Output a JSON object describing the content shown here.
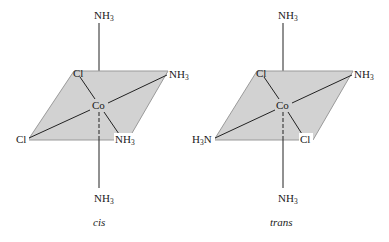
{
  "figure": {
    "type": "octahedral coordination complex isomers",
    "colors": {
      "plane_fill": "#d2d2d2",
      "plane_edge": "#9a9a9a",
      "bond": "#222222",
      "text": "#1a1a1a",
      "background": "#ffffff"
    },
    "isomers": [
      {
        "caption": "cis",
        "center": "Co",
        "ligands": {
          "top": {
            "main": "NH",
            "sub": "3"
          },
          "bottom": {
            "main": "NH",
            "sub": "3"
          },
          "back_left": {
            "main": "Cl",
            "sub": ""
          },
          "back_right": {
            "main": "NH",
            "sub": "3"
          },
          "front_left": {
            "main": "Cl",
            "sub": ""
          },
          "front_right": {
            "main": "NH",
            "sub": "3"
          }
        }
      },
      {
        "caption": "trans",
        "center": "Co",
        "ligands": {
          "top": {
            "main": "NH",
            "sub": "3"
          },
          "bottom": {
            "main": "NH",
            "sub": "3"
          },
          "back_left": {
            "main": "Cl",
            "sub": ""
          },
          "back_right": {
            "main": "NH",
            "sub": "3"
          },
          "front_left": {
            "pre": "H",
            "presub": "3",
            "main": "N"
          },
          "front_right": {
            "main": "Cl",
            "sub": ""
          }
        }
      }
    ]
  }
}
